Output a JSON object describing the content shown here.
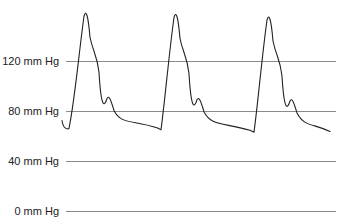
{
  "chart_data": {
    "type": "line",
    "title": "",
    "xlabel": "",
    "ylabel": "",
    "unit": "mm Hg",
    "ylim": [
      0,
      170
    ],
    "grid": true,
    "legend": null,
    "yticks": [
      {
        "value": 120,
        "label": "120 mm Hg"
      },
      {
        "value": 80,
        "label": "80 mm Hg"
      },
      {
        "value": 40,
        "label": "40 mm Hg"
      },
      {
        "value": 0,
        "label": "0 mm Hg"
      }
    ],
    "series": [
      {
        "name": "arterial pressure waveform",
        "color": "#222222",
        "description": "Three cardiac cycles: rapid systolic upstroke to ~158 mmHg, shoulder, dicrotic notch ~90 mmHg, diastolic decay to ~64 mmHg",
        "beats": [
          {
            "systolic_peak": 159,
            "dicrotic_notch": 90,
            "end_diastolic": 66
          },
          {
            "systolic_peak": 158,
            "dicrotic_notch": 89,
            "end_diastolic": 65
          },
          {
            "systolic_peak": 156,
            "dicrotic_notch": 88,
            "end_diastolic": 63
          }
        ]
      }
    ]
  }
}
